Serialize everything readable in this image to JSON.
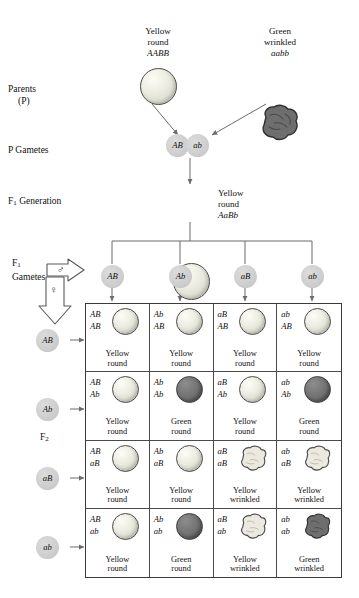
{
  "diagram": {
    "stage_labels": {
      "parents": "Parents",
      "parents_sub": "(P)",
      "p_gametes": "P Gametes",
      "f1_generation_pre": "F",
      "f1_generation_sub": "1",
      "f1_generation_post": " Generation",
      "f1_gametes_pre": "F",
      "f1_gametes_sub": "1",
      "f1_gametes_post": "Gametes",
      "f2_pre": "F",
      "f2_sub": "2"
    },
    "parents": [
      {
        "trait_line1": "Yellow",
        "trait_line2": "round",
        "genotype": "AABB",
        "seed": "yellow-round"
      },
      {
        "trait_line1": "Green",
        "trait_line2": "wrinkled",
        "genotype": "aabb",
        "seed": "green-wrinkled"
      }
    ],
    "p_gametes": [
      "AB",
      "ab"
    ],
    "f1": {
      "trait_line1": "Yellow",
      "trait_line2": "round",
      "genotype": "AaBb",
      "seed": "yellow-round"
    },
    "sex_symbols": {
      "male": "♂",
      "female": "♀"
    },
    "f1_gametes_male": [
      "AB",
      "Ab",
      "aB",
      "ab"
    ],
    "f1_gametes_female": [
      "AB",
      "Ab",
      "aB",
      "ab"
    ],
    "punnett": {
      "rows": [
        {
          "row_gamete": "AB",
          "cells": [
            {
              "allele_top": "AB",
              "allele_bottom": "AB",
              "cap_line1": "Yellow",
              "cap_line2": "round",
              "seed": "yellow-round"
            },
            {
              "allele_top": "Ab",
              "allele_bottom": "AB",
              "cap_line1": "Yellow",
              "cap_line2": "round",
              "seed": "yellow-round"
            },
            {
              "allele_top": "aB",
              "allele_bottom": "AB",
              "cap_line1": "Yellow",
              "cap_line2": "round",
              "seed": "yellow-round"
            },
            {
              "allele_top": "ab",
              "allele_bottom": "AB",
              "cap_line1": "Yellow",
              "cap_line2": "round",
              "seed": "yellow-round"
            }
          ]
        },
        {
          "row_gamete": "Ab",
          "cells": [
            {
              "allele_top": "AB",
              "allele_bottom": "Ab",
              "cap_line1": "Yellow",
              "cap_line2": "round",
              "seed": "yellow-round"
            },
            {
              "allele_top": "Ab",
              "allele_bottom": "Ab",
              "cap_line1": "Green",
              "cap_line2": "round",
              "seed": "green-round"
            },
            {
              "allele_top": "aB",
              "allele_bottom": "Ab",
              "cap_line1": "Yellow",
              "cap_line2": "round",
              "seed": "yellow-round"
            },
            {
              "allele_top": "ab",
              "allele_bottom": "Ab",
              "cap_line1": "Green",
              "cap_line2": "round",
              "seed": "green-round"
            }
          ]
        },
        {
          "row_gamete": "aB",
          "cells": [
            {
              "allele_top": "AB",
              "allele_bottom": "aB",
              "cap_line1": "Yellow",
              "cap_line2": "round",
              "seed": "yellow-round"
            },
            {
              "allele_top": "Ab",
              "allele_bottom": "aB",
              "cap_line1": "Yellow",
              "cap_line2": "round",
              "seed": "yellow-round"
            },
            {
              "allele_top": "aB",
              "allele_bottom": "aB",
              "cap_line1": "Yellow",
              "cap_line2": "wrinkled",
              "seed": "yellow-wrinkled"
            },
            {
              "allele_top": "ab",
              "allele_bottom": "aB",
              "cap_line1": "Yellow",
              "cap_line2": "wrinkled",
              "seed": "yellow-wrinkled"
            }
          ]
        },
        {
          "row_gamete": "ab",
          "cells": [
            {
              "allele_top": "AB",
              "allele_bottom": "ab",
              "cap_line1": "Yellow",
              "cap_line2": "round",
              "seed": "yellow-round"
            },
            {
              "allele_top": "Ab",
              "allele_bottom": "ab",
              "cap_line1": "Green",
              "cap_line2": "round",
              "seed": "green-round"
            },
            {
              "allele_top": "aB",
              "allele_bottom": "ab",
              "cap_line1": "Yellow",
              "cap_line2": "wrinkled",
              "seed": "yellow-wrinkled"
            },
            {
              "allele_top": "ab",
              "allele_bottom": "ab",
              "cap_line1": "Green",
              "cap_line2": "wrinkled",
              "seed": "green-wrinkled"
            }
          ]
        }
      ]
    },
    "colors": {
      "line": "#6b6b6b",
      "grid_border": "#3a3a3a",
      "gamete_fill": "#cfcfcf",
      "yellow_seed": "#eeeee4",
      "green_seed": "#6a6a6a",
      "text": "#111111"
    }
  }
}
